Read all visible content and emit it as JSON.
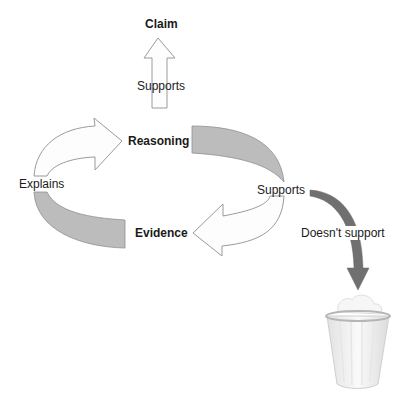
{
  "diagram": {
    "nodes": {
      "claim": "Claim",
      "reasoning": "Reasoning",
      "evidence": "Evidence"
    },
    "edges": {
      "reasoning_to_claim": "Supports",
      "evidence_to_reasoning": "Explains",
      "reasoning_to_evidence": "Supports",
      "to_trash": "Doesn't support"
    },
    "icons": {
      "trash": "trash-can-icon"
    },
    "colors": {
      "arrow_fill": "#fdfdfd",
      "arrow_stroke": "#9a9a9a",
      "band_fill": "#bcbcbc",
      "band_stroke": "#8f8f8f",
      "reject_arrow": "#707070"
    }
  }
}
